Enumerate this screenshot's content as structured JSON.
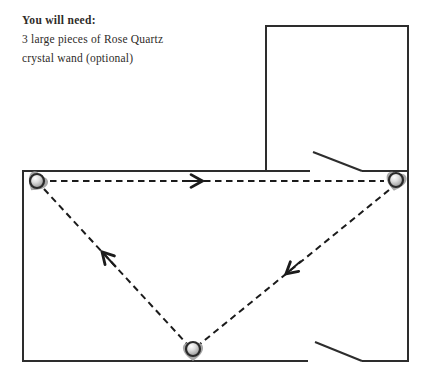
{
  "page": {
    "background_color": "#ffffff",
    "text_color": "#2e2b28",
    "wall_color": "#2d2d2d",
    "dash_color": "#1b1b1b"
  },
  "materials": {
    "heading": "You will need:",
    "items": [
      "3 large pieces of Rose Quartz",
      "crystal wand (optional)"
    ]
  },
  "diagram": {
    "type": "floor-plan",
    "rooms": 2,
    "doors": 2,
    "crystals": [
      {
        "name": "rose-quartz-top-left"
      },
      {
        "name": "rose-quartz-top-right"
      },
      {
        "name": "rose-quartz-bottom-center"
      }
    ],
    "energy_path": {
      "style": "dashed",
      "segments": [
        "top-left crystal to top-right crystal, arrow pointing right",
        "top-right crystal to bottom-center crystal, arrow pointing down-left",
        "bottom-center crystal to top-left crystal, arrow pointing up-left"
      ]
    },
    "crystal_colors": {
      "blob": "#9d9d9d",
      "sphere_highlight": "#ffffff",
      "sphere_mid": "#c9c9c9",
      "sphere_shadow": "#868686",
      "ring": "#2a2a2a"
    }
  }
}
